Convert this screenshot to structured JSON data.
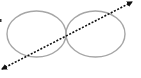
{
  "diagram": {
    "type": "two tangent ellipses crossed by a bidirectional dotted arrow",
    "background": "#ffffff",
    "shapes": [
      {
        "id": "left-ellipse",
        "cx": 36.5,
        "cy": 34,
        "rx": 29.5,
        "ry": 23,
        "stroke": "#a6a6a6",
        "fill": "none"
      },
      {
        "id": "right-ellipse",
        "cx": 95.5,
        "cy": 34,
        "rx": 29.5,
        "ry": 23,
        "stroke": "#a6a6a6",
        "fill": "none"
      }
    ],
    "arrow": {
      "id": "dotted-double-arrow",
      "x1": 2,
      "y1": 69,
      "x2": 132,
      "y2": 2,
      "style": "dotted",
      "stroke": "#111111",
      "heads": "both"
    },
    "marks": [
      {
        "id": "edge-mark",
        "x": 0,
        "y": 19,
        "color": "#333333"
      }
    ]
  }
}
